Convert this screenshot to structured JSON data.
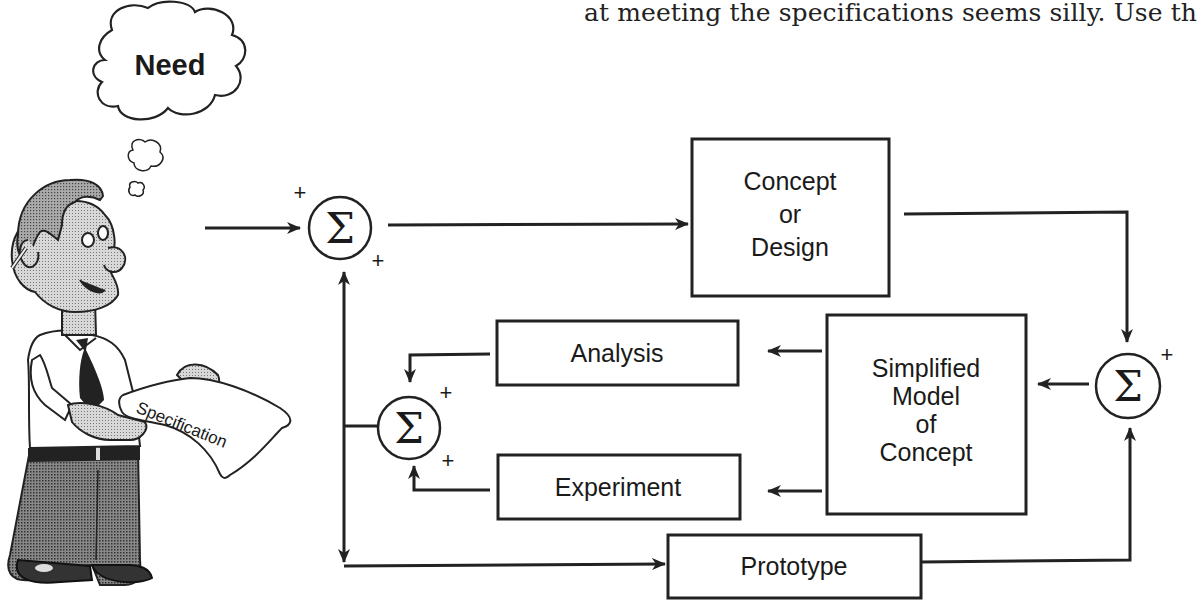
{
  "page": {
    "top_text": "at meeting the specifications seems silly. Use th"
  },
  "figure": {
    "thought_bubble": {
      "label": "Need"
    },
    "person": {
      "document_label": "Specification"
    },
    "summing_junctions": [
      {
        "id": "sum-main",
        "symbol": "Σ",
        "signs": [
          "+",
          "+"
        ]
      },
      {
        "id": "sum-right",
        "symbol": "Σ",
        "signs": [
          "+"
        ]
      },
      {
        "id": "sum-inner",
        "symbol": "Σ",
        "signs": [
          "+",
          "+"
        ]
      }
    ],
    "blocks": {
      "concept": [
        "Concept",
        "or",
        "Design"
      ],
      "simplified_model": [
        "Simplified",
        "Model",
        "of",
        "Concept"
      ],
      "analysis": "Analysis",
      "experiment": "Experiment",
      "prototype": "Prototype"
    },
    "colors": {
      "line": "#222222",
      "background": "#ffffff",
      "shade_dark": "#555555",
      "shade_light": "#bdbdbd"
    }
  }
}
